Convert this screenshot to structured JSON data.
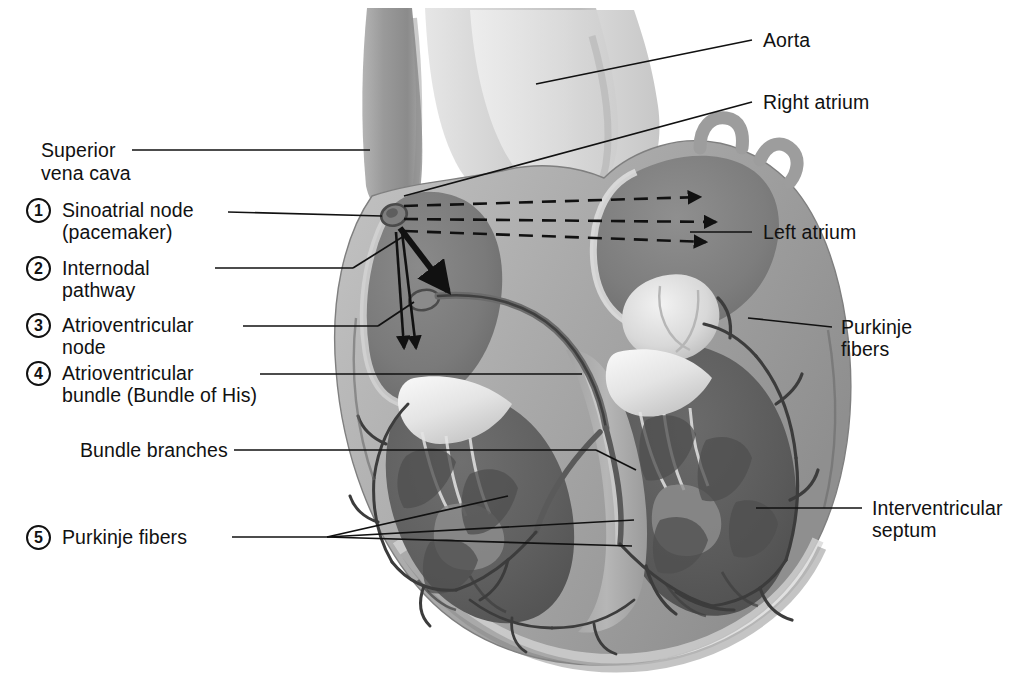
{
  "figure": {
    "kind": "anatomical-illustration",
    "style": "grayscale airbrush cutaway, coronal section",
    "width": 1017,
    "height": 695
  },
  "palette": {
    "background": "#ffffff",
    "ink": "#111111",
    "myocardium_mid": "#8d8d8d",
    "myocardium_dark": "#6b6b6b",
    "myocardium_darkest": "#565656",
    "chamber_shadow": "#767676",
    "endocardium_light": "#d9d9d9",
    "valve_white": "#f1f1f1",
    "vessel_light": "#c9c9c9",
    "vessel_mid": "#a8a8a8",
    "epicardium_pale": "#bdbdbd",
    "conduction_line": "#4a4a4a"
  },
  "numbered_labels": [
    {
      "number": "1",
      "lines": [
        "Sinoatrial node",
        "(pacemaker)"
      ]
    },
    {
      "number": "2",
      "lines": [
        "Internodal",
        "pathway"
      ]
    },
    {
      "number": "3",
      "lines": [
        "Atrioventricular",
        "node"
      ]
    },
    {
      "number": "4",
      "lines": [
        "Atrioventricular",
        "bundle (Bundle of His)"
      ]
    },
    {
      "number": "5",
      "lines": [
        "Purkinje fibers"
      ]
    }
  ],
  "plain_labels_left": [
    {
      "lines": [
        "Superior",
        "vena cava"
      ]
    },
    {
      "lines": [
        "Bundle branches"
      ]
    }
  ],
  "plain_labels_right": [
    {
      "lines": [
        "Aorta"
      ]
    },
    {
      "lines": [
        "Right atrium"
      ]
    },
    {
      "lines": [
        "Left atrium"
      ]
    },
    {
      "lines": [
        "Purkinje",
        "fibers"
      ]
    },
    {
      "lines": [
        "Interventricular",
        "septum"
      ]
    }
  ],
  "label_text": {
    "superior": "Superior",
    "vena_cava": "vena cava",
    "sinoatrial_node": "Sinoatrial node",
    "pacemaker": "(pacemaker)",
    "internodal": "Internodal",
    "pathway": "pathway",
    "atrioventricular_3": "Atrioventricular",
    "node": "node",
    "atrioventricular_4": "Atrioventricular",
    "bundle_of_his": "bundle (Bundle of His)",
    "bundle_branches": "Bundle branches",
    "purkinje_fibers_left": "Purkinje fibers",
    "aorta": "Aorta",
    "right_atrium": "Right atrium",
    "left_atrium": "Left atrium",
    "purkinje_right_1": "Purkinje",
    "purkinje_right_2": "fibers",
    "interventricular": "Interventricular",
    "septum": "septum"
  },
  "badge_numbers": {
    "one": "1",
    "two": "2",
    "three": "3",
    "four": "4",
    "five": "5"
  },
  "conduction_flow": {
    "internodal_arrows": 3,
    "internodal_arrow_style": "dashed",
    "av_arrows": 3,
    "av_arrow_style": "solid",
    "description": "Impulse begins at sinoatrial node, spreads through atria via internodal pathways to the atrioventricular node, then down the bundle of His into bundle branches and Purkinje fibers."
  }
}
